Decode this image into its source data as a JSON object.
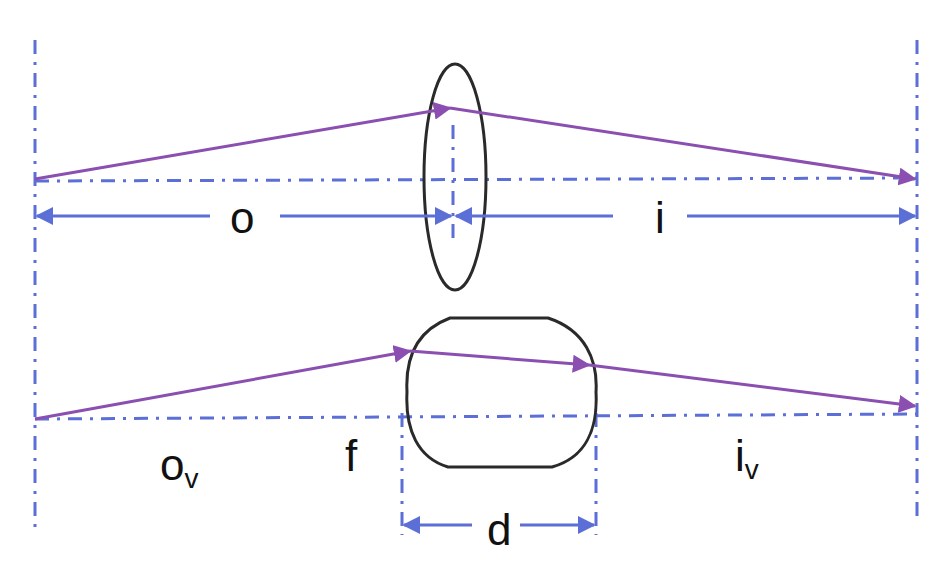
{
  "colors": {
    "ray": "#8a4fb0",
    "axis": "#5b6fd6",
    "lens": "#2a2a2a",
    "label": "#111111",
    "background": "#ffffff"
  },
  "top_diagram": {
    "description": "Thin lens: ray from object plane through thin lens to image plane",
    "labels": {
      "object_distance": "o",
      "image_distance": "i"
    }
  },
  "bottom_diagram": {
    "description": "Thick lens (rounded rectangle) of thickness d with virtual distances",
    "labels": {
      "virtual_object_distance": "o",
      "virtual_object_subscript": "v",
      "focal": "f",
      "thickness": "d",
      "virtual_image_distance": "i",
      "virtual_image_subscript": "v"
    }
  }
}
